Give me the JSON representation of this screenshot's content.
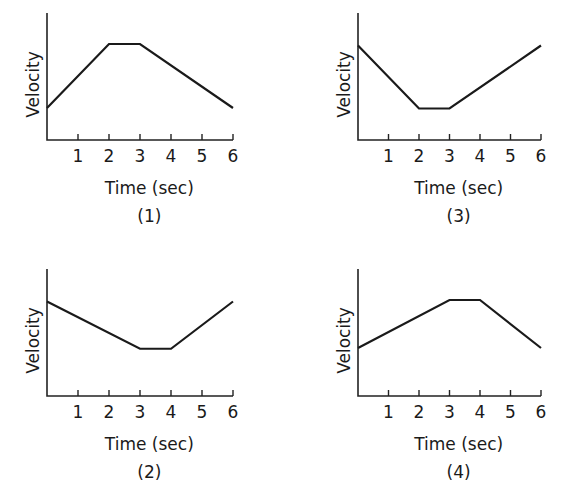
{
  "chart_data": [
    {
      "type": "line",
      "caption": "(1)",
      "title": "",
      "xlabel": "Time (sec)",
      "ylabel": "Velocity",
      "x_ticks": [
        "1",
        "2",
        "3",
        "4",
        "5",
        "6"
      ],
      "xlim": [
        0,
        6
      ],
      "ylim": [
        0,
        4
      ],
      "grid": false,
      "x": [
        0,
        2,
        3,
        6
      ],
      "values": [
        1,
        3,
        3,
        1
      ],
      "panel": {
        "left": 0,
        "top": 0,
        "origin_x": 47,
        "origin_y": 140,
        "unit_x": 31,
        "unit_y": 32,
        "axis_top": 13
      }
    },
    {
      "type": "line",
      "caption": "(3)",
      "title": "",
      "xlabel": "Time (sec)",
      "ylabel": "Velocity",
      "x_ticks": [
        "1",
        "2",
        "3",
        "4",
        "5",
        "6"
      ],
      "xlim": [
        0,
        6
      ],
      "ylim": [
        0,
        4
      ],
      "grid": false,
      "x": [
        0,
        2,
        3,
        6
      ],
      "values": [
        3,
        1,
        1,
        3
      ],
      "panel": {
        "left": 0,
        "top": 0,
        "origin_x": 358,
        "origin_y": 140,
        "unit_x": 30.5,
        "unit_y": 31.5,
        "axis_top": 13
      }
    },
    {
      "type": "line",
      "caption": "(2)",
      "title": "",
      "xlabel": "Time (sec)",
      "ylabel": "Velocity",
      "x_ticks": [
        "1",
        "2",
        "3",
        "4",
        "5",
        "6"
      ],
      "xlim": [
        0,
        6
      ],
      "ylim": [
        0,
        4
      ],
      "grid": false,
      "x": [
        0,
        3,
        4,
        6
      ],
      "values": [
        3,
        1.5,
        1.5,
        3
      ],
      "panel": {
        "left": 0,
        "top": 0,
        "origin_x": 47,
        "origin_y": 396,
        "unit_x": 31,
        "unit_y": 31.5,
        "axis_top": 269
      }
    },
    {
      "type": "line",
      "caption": "(4)",
      "title": "",
      "xlabel": "Time (sec)",
      "ylabel": "Velocity",
      "x_ticks": [
        "1",
        "2",
        "3",
        "4",
        "5",
        "6"
      ],
      "xlim": [
        0,
        6
      ],
      "ylim": [
        0,
        4
      ],
      "grid": false,
      "x": [
        0,
        3,
        4,
        6
      ],
      "values": [
        1.5,
        3,
        3,
        1.5
      ],
      "panel": {
        "left": 0,
        "top": 0,
        "origin_x": 358,
        "origin_y": 396,
        "unit_x": 30.5,
        "unit_y": 32,
        "axis_top": 269
      }
    }
  ]
}
